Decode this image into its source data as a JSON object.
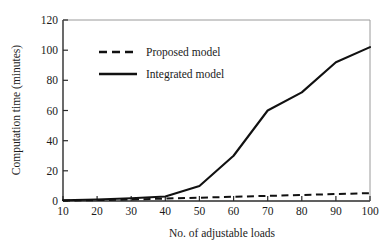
{
  "chart_data": {
    "type": "line",
    "title": "",
    "xlabel": "No. of adjustable loads",
    "ylabel": "Computation time (minutes)",
    "xlim": [
      10,
      100
    ],
    "ylim": [
      0,
      120
    ],
    "xticks": [
      10,
      20,
      30,
      40,
      50,
      60,
      70,
      80,
      90,
      100
    ],
    "yticks": [
      0,
      20,
      40,
      60,
      80,
      100,
      120
    ],
    "grid": false,
    "legend_position": "upper-left-inside",
    "x": [
      10,
      20,
      30,
      40,
      50,
      60,
      70,
      80,
      90,
      100
    ],
    "series": [
      {
        "name": "Proposed model",
        "style": "dashed",
        "color": "#111111",
        "values": [
          0.3,
          0.6,
          1.0,
          1.6,
          2.2,
          2.8,
          3.4,
          4.0,
          4.6,
          5.2
        ]
      },
      {
        "name": "Integrated model",
        "style": "solid",
        "color": "#111111",
        "values": [
          0.5,
          1.0,
          1.8,
          3.0,
          10.0,
          30.0,
          60.0,
          72.0,
          92.0,
          102.0
        ]
      }
    ]
  },
  "axes": {
    "x_tick_labels": [
      "10",
      "20",
      "30",
      "40",
      "50",
      "60",
      "70",
      "80",
      "90",
      "100"
    ],
    "y_tick_labels": [
      "0",
      "20",
      "40",
      "60",
      "80",
      "100",
      "120"
    ],
    "x_axis_title": "No. of adjustable loads",
    "y_axis_title": "Computation time (minutes)"
  },
  "legend": {
    "entries": [
      {
        "label": "Proposed model",
        "swatch": "dashed-line-swatch"
      },
      {
        "label": "Integrated model",
        "swatch": "solid-line-swatch"
      }
    ]
  },
  "colors": {
    "line": "#111111",
    "axis": "#444444",
    "background": "#ffffff"
  }
}
